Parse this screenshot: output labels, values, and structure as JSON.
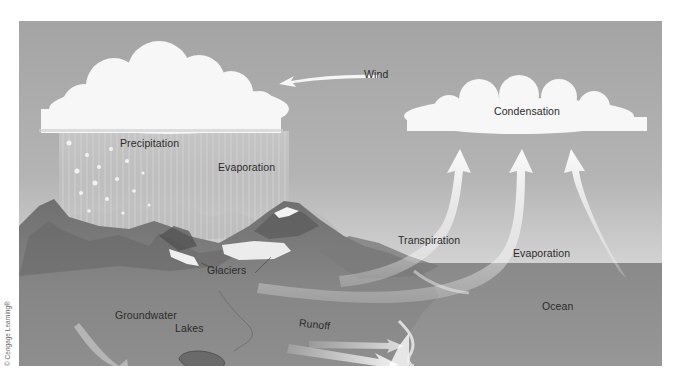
{
  "figure": {
    "type": "water-cycle-diagram",
    "labels": {
      "wind": "Wind",
      "condensation": "Condensation",
      "precipitation": "Precipitation",
      "evaporation_land": "Evaporation",
      "transpiration": "Transpiration",
      "evaporation_ocean": "Evaporation",
      "glaciers": "Glaciers",
      "groundwater": "Groundwater",
      "lakes": "Lakes",
      "runoff": "Runoff",
      "ocean": "Ocean"
    },
    "credit": "© Cengage Learning®",
    "colors": {
      "sky_top": "#a7a7a7",
      "sky_horizon": "#e4e4e4",
      "ocean": "#8f8f8f",
      "land": "#7d7d7d",
      "cloud": "#f7f7f7",
      "arrow": "#f4f4f4",
      "text": "#2b2b2b"
    }
  }
}
